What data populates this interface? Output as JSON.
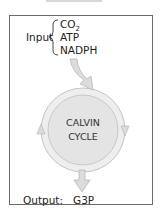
{
  "diagram": {
    "input_label": "Input",
    "inputs": [
      "CO",
      "ATP",
      "NADPH"
    ],
    "co2_subscript": "2",
    "cycle_line1": "CALVIN",
    "cycle_line2": "CYCLE",
    "output_label": "Output:",
    "output_value": "G3P",
    "colors": {
      "cycle_fill": "#e6e6e6",
      "arrow_fill": "#dcdcdc",
      "arrow_stroke": "#b8b8b8",
      "frame": "#6a6a6a",
      "text": "#222222"
    }
  }
}
